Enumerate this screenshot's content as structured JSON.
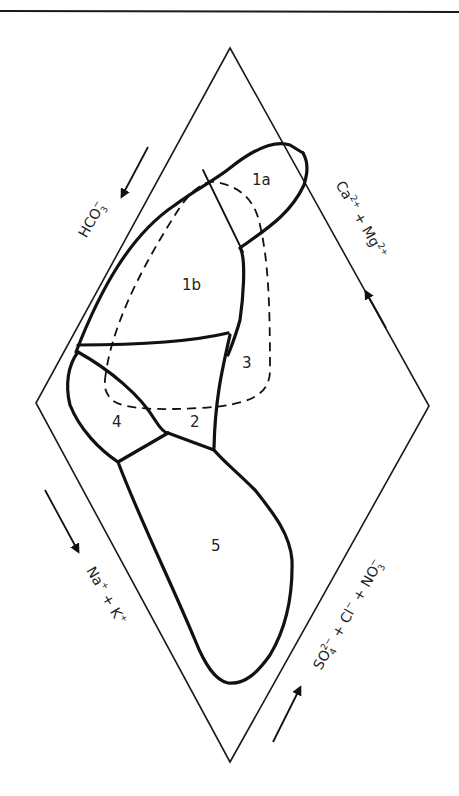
{
  "diagram": {
    "type": "piper-diamond",
    "regions": [
      {
        "id": "1a",
        "label": "1a"
      },
      {
        "id": "1b",
        "label": "1b"
      },
      {
        "id": "2",
        "label": "2"
      },
      {
        "id": "3",
        "label": "3"
      },
      {
        "id": "4",
        "label": "4"
      },
      {
        "id": "5",
        "label": "5"
      }
    ],
    "axes": {
      "upper_left": {
        "base": "HCO",
        "sub": "3",
        "sup": "−",
        "direction": "down-left"
      },
      "upper_right": {
        "part1_base": "Ca",
        "part1_sup": "2+",
        "plus": " + ",
        "part2_base": "Mg",
        "part2_sup": "2+",
        "direction": "up-left"
      },
      "lower_left": {
        "part1_base": "Na",
        "part1_sup": "+",
        "plus": " + ",
        "part2_base": "K",
        "part2_sup": "+",
        "direction": "down-right"
      },
      "lower_right": {
        "part1_base": "SO",
        "part1_sub": "4",
        "part1_sup": "2−",
        "plus1": " + ",
        "part2_base": "Cl",
        "part2_sup": "−",
        "plus2": " + ",
        "part3_base": "NO",
        "part3_sub": "3",
        "part3_sup": "−",
        "direction": "up-right"
      }
    },
    "colors": {
      "line": "#111111",
      "background": "#ffffff"
    }
  }
}
